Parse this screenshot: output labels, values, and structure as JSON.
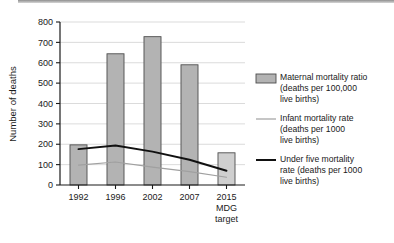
{
  "chart_data": {
    "type": "bar",
    "title": "",
    "xlabel": "",
    "ylabel": "Number of deaths",
    "ylim": [
      0,
      800
    ],
    "yticks": [
      0,
      100,
      200,
      300,
      400,
      500,
      600,
      700,
      800
    ],
    "ytick_labels": [
      "0",
      "100",
      "200",
      "300",
      "400",
      "500",
      "600",
      "700",
      "800"
    ],
    "grid": true,
    "legend_position": "right",
    "categories": [
      "1992",
      "1996",
      "2002",
      "2007",
      "2015 MDG target"
    ],
    "category_lines": [
      [
        "1992"
      ],
      [
        "1996"
      ],
      [
        "2002"
      ],
      [
        "2007"
      ],
      [
        "2015",
        "MDG",
        "target"
      ]
    ],
    "series": [
      {
        "name": "Maternal mortality ratio (deaths per 100,000 live births)",
        "type": "bar",
        "values": [
          197,
          644,
          728,
          590,
          158
        ],
        "color": "#b3b3b3",
        "edge_color": "#4d4d4d"
      },
      {
        "name": "Infant mortality rate (deaths per 1000 live births)",
        "type": "line",
        "values": [
          98,
          113,
          88,
          66,
          38
        ],
        "color": "#a0a0a0"
      },
      {
        "name": "Under five mortality rate (deaths per 1000 live births)",
        "type": "line",
        "values": [
          176,
          194,
          164,
          124,
          70
        ],
        "color": "#111111"
      }
    ]
  },
  "axis": {
    "y_title": "Number of deaths"
  },
  "legend": {
    "items": [
      {
        "marker": "swatch",
        "lines": [
          "Maternal mortality ratio",
          "(deaths per 100,000",
          "live births)"
        ]
      },
      {
        "marker": "thin-line",
        "lines": [
          "Infant mortality rate",
          "(deaths per 1000",
          "live births)"
        ]
      },
      {
        "marker": "thick-line",
        "lines": [
          "Under five mortality",
          "rate (deaths per 1000",
          "live births)"
        ]
      }
    ]
  }
}
